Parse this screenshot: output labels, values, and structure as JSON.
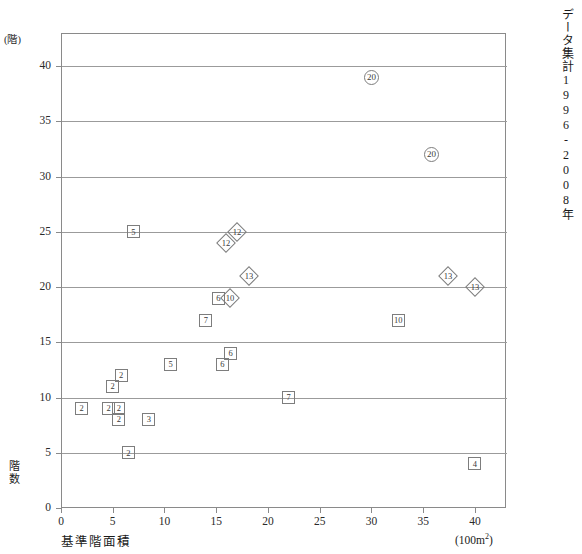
{
  "figure": {
    "top_caption": "",
    "side_caption": "データ集計1996-2008年",
    "y_axis": {
      "unit": "(階)",
      "name": "階数",
      "ticks": [
        "0",
        "5",
        "10",
        "15",
        "20",
        "25",
        "30",
        "35",
        "40"
      ],
      "min": 0,
      "max": 43
    },
    "x_axis": {
      "name": "基準階面積",
      "unit": "(100m2)",
      "ticks": [
        "0",
        "5",
        "10",
        "15",
        "20",
        "25",
        "30",
        "35",
        "40"
      ],
      "min": 0,
      "max": 43
    }
  },
  "chart_data": {
    "type": "scatter",
    "title": "",
    "xlabel": "基準階面積 (100m2)",
    "ylabel": "階数 (階)",
    "xlim": [
      0,
      43
    ],
    "ylim": [
      0,
      43
    ],
    "grid": true,
    "legend": "none",
    "marker_shapes": [
      "square",
      "diamond",
      "circle"
    ],
    "points": [
      {
        "x": 2.0,
        "y": 9,
        "label": "2",
        "shape": "square"
      },
      {
        "x": 4.6,
        "y": 9,
        "label": "2",
        "shape": "square"
      },
      {
        "x": 5.6,
        "y": 9,
        "label": "2",
        "shape": "square"
      },
      {
        "x": 5.6,
        "y": 8,
        "label": "2",
        "shape": "square"
      },
      {
        "x": 5.0,
        "y": 11,
        "label": "2",
        "shape": "square"
      },
      {
        "x": 5.8,
        "y": 12,
        "label": "2",
        "shape": "square"
      },
      {
        "x": 6.5,
        "y": 5,
        "label": "2",
        "shape": "square"
      },
      {
        "x": 8.5,
        "y": 8,
        "label": "3",
        "shape": "square"
      },
      {
        "x": 7.0,
        "y": 25,
        "label": "5",
        "shape": "square"
      },
      {
        "x": 10.6,
        "y": 13,
        "label": "5",
        "shape": "square"
      },
      {
        "x": 15.6,
        "y": 13,
        "label": "6",
        "shape": "square"
      },
      {
        "x": 16.4,
        "y": 14,
        "label": "6",
        "shape": "square"
      },
      {
        "x": 14.0,
        "y": 17,
        "label": "7",
        "shape": "square"
      },
      {
        "x": 15.2,
        "y": 19,
        "label": "6",
        "shape": "square"
      },
      {
        "x": 16.3,
        "y": 19,
        "label": "10",
        "shape": "diamond"
      },
      {
        "x": 15.9,
        "y": 24,
        "label": "12",
        "shape": "diamond"
      },
      {
        "x": 17.0,
        "y": 25,
        "label": "12",
        "shape": "diamond"
      },
      {
        "x": 18.2,
        "y": 21,
        "label": "13",
        "shape": "diamond"
      },
      {
        "x": 22.0,
        "y": 10,
        "label": "7",
        "shape": "square"
      },
      {
        "x": 30.0,
        "y": 39,
        "label": "20",
        "shape": "circle"
      },
      {
        "x": 32.6,
        "y": 17,
        "label": "10",
        "shape": "square"
      },
      {
        "x": 35.8,
        "y": 32,
        "label": "20",
        "shape": "circle"
      },
      {
        "x": 37.4,
        "y": 21,
        "label": "13",
        "shape": "diamond"
      },
      {
        "x": 40.0,
        "y": 20,
        "label": "13",
        "shape": "diamond"
      },
      {
        "x": 40.0,
        "y": 4,
        "label": "4",
        "shape": "square"
      }
    ]
  }
}
